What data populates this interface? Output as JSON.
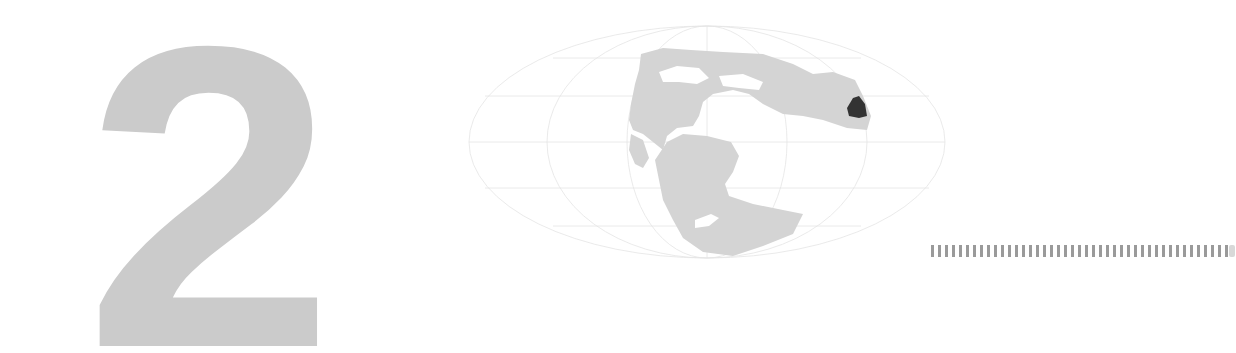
{
  "chapter": {
    "number": "2"
  },
  "map": {
    "projection": "mollweide-style ellipse",
    "land_color": "#d4d4d4",
    "highlight_color": "#333333",
    "grid_color": "#e6e6e6",
    "highlight_region_label": "highlighted region"
  },
  "decor": {
    "tick_bar_color": "#9a9a9a"
  }
}
